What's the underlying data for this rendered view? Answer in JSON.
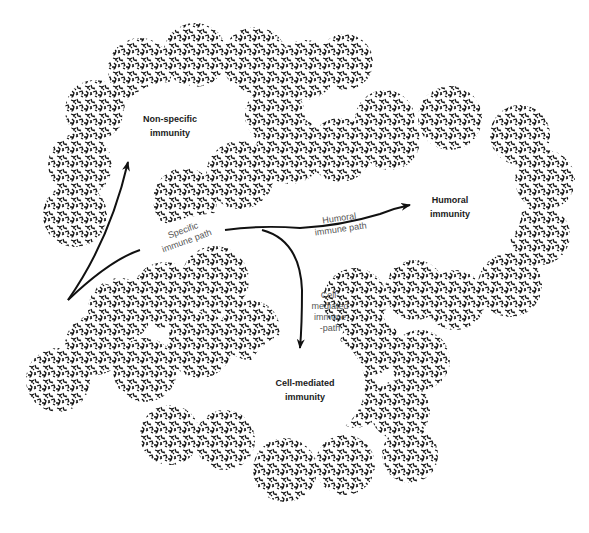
{
  "diagram": {
    "type": "immune-pathway-illustration",
    "background_color": "#ffffff",
    "ink_color": "#111111",
    "nodes": [
      {
        "id": "non_specific",
        "label_line1": "Non-specific",
        "label_line2": "immunity"
      },
      {
        "id": "humoral",
        "label_line1": "Humoral",
        "label_line2": "immunity"
      },
      {
        "id": "cell_mediated",
        "label_line1": "Cell-mediated",
        "label_line2": "immunity"
      }
    ],
    "paths": [
      {
        "id": "specific",
        "label_line1": "Specific",
        "label_line2": "immune path"
      },
      {
        "id": "humoral_path",
        "label_line1": "Humoral",
        "label_line2": "immune path"
      },
      {
        "id": "cell_path",
        "label_line1": "Cell-",
        "label_line2": "mediated",
        "label_line3": "immune",
        "label_line4": "-path"
      }
    ],
    "edges": [
      {
        "from": "origin",
        "to": "non_specific"
      },
      {
        "from": "origin",
        "to": "humoral",
        "via": "specific"
      },
      {
        "from": "specific",
        "to": "cell_mediated"
      }
    ]
  }
}
